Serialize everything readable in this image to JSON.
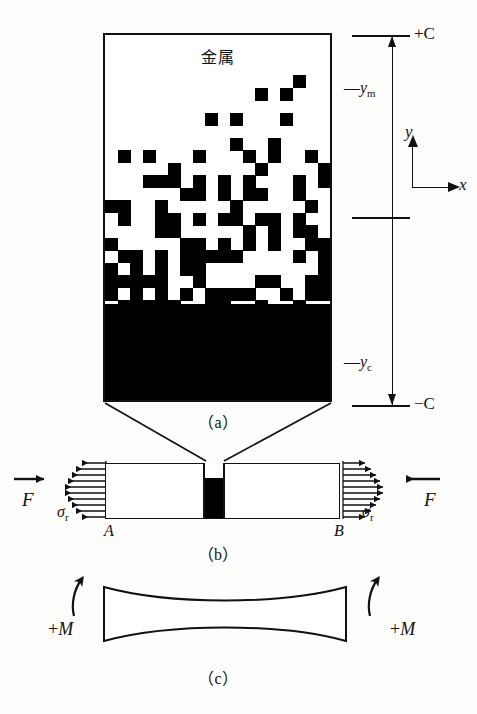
{
  "figure": {
    "panels": [
      {
        "id": "a",
        "caption": "（a）",
        "material_label": "金属",
        "axis": {
          "top_label": "+C",
          "bottom_label": "−C",
          "tick_labels": [
            "— yₘ",
            "— yᶜ"
          ],
          "ym_label_base": "y",
          "ym_label_sub": "m",
          "yc_label_base": "y",
          "yc_label_sub": "c",
          "dash": "—"
        },
        "coord_axes": {
          "y_label": "y",
          "x_label": "x"
        }
      },
      {
        "id": "b",
        "caption": "（b）",
        "force_label": "F",
        "stress_label_base": "σ",
        "stress_label_sub": "r",
        "end_label_left": "A",
        "end_label_right": "B"
      },
      {
        "id": "c",
        "caption": "（c）",
        "moment_label_left": "+M",
        "moment_label_right": "+M",
        "moment_sign": "+",
        "moment_symbol": "M"
      }
    ],
    "colors": {
      "ink": "#111111",
      "paper": "#fdfdfc",
      "fill_black": "#000000"
    }
  },
  "chart_data": {
    "type": "heatmap",
    "title": "金属",
    "xlabel": "x",
    "ylabel": "y",
    "axis_range": [
      "+C",
      "−C"
    ],
    "annotations": [
      "— yₘ",
      "— yᶜ"
    ],
    "gradient_profile": {
      "rows": 26,
      "cols": 18,
      "density_top": 0.04,
      "density_bottom": 1.0,
      "note": "row density approximately follows (row/rows)^1.35"
    }
  }
}
